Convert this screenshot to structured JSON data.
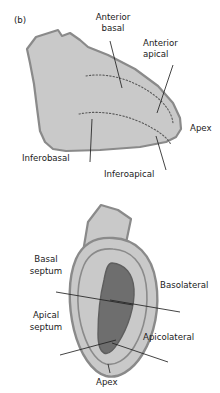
{
  "figure": {
    "panel_tag": "(b)",
    "colors": {
      "myocardium_fill": "#c9c9c9",
      "outline_stroke": "#8a8a8a",
      "cavity_fill": "#6e6e6e",
      "cavity_stroke": "#5e5e5e",
      "segment_divider": "#5a5a5a",
      "leader_line": "#222222",
      "text": "#1a1a1a",
      "background": "#ffffff"
    }
  },
  "upper_view": {
    "name": "long-axis-lateral-view",
    "labels": {
      "anterior_basal": {
        "line1": "Anterior",
        "line2": "basal"
      },
      "anterior_apical": {
        "line1": "Anterior",
        "line2": "apical"
      },
      "apex": "Apex",
      "inferobasal": "Inferobasal",
      "inferoapical": "Inferoapical"
    }
  },
  "lower_view": {
    "name": "long-axis-four-chamber-view",
    "labels": {
      "basal_septum": {
        "line1": "Basal",
        "line2": "septum"
      },
      "apical_septum": {
        "line1": "Apical",
        "line2": "septum"
      },
      "basolateral": "Basolateral",
      "apicolateral": "Apicolateral",
      "apex": "Apex"
    }
  }
}
